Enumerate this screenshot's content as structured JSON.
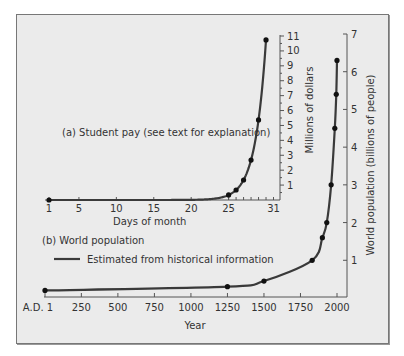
{
  "chart_data": [
    {
      "id": "a",
      "type": "line",
      "title": "(a)  Student pay (see text for explanation)",
      "xlabel": "Days of month",
      "ylabel": "Millions of dollars",
      "xticks": [
        1,
        5,
        10,
        15,
        20,
        25,
        31
      ],
      "yticks": [
        1,
        2,
        3,
        4,
        5,
        6,
        7,
        8,
        9,
        10,
        11
      ],
      "xlim": [
        1,
        31
      ],
      "ylim": [
        0,
        11
      ],
      "points": [
        {
          "x": 1,
          "y": 0.0
        },
        {
          "x": 25,
          "y": 0.34
        },
        {
          "x": 26,
          "y": 0.67
        },
        {
          "x": 27,
          "y": 1.34
        },
        {
          "x": 28,
          "y": 2.68
        },
        {
          "x": 29,
          "y": 5.37
        },
        {
          "x": 30,
          "y": 10.74
        }
      ],
      "note": "Curve doubles each day; markers on last days of month"
    },
    {
      "id": "b",
      "type": "line",
      "title": "(b)  World population",
      "legend": [
        {
          "label": "Estimated from historical information"
        }
      ],
      "xlabel": "Year",
      "ylabel": "World population (billions of people)",
      "xticks": [
        "A.D. 1",
        "250",
        "500",
        "750",
        "1000",
        "1250",
        "1500",
        "1750",
        "2000"
      ],
      "yticks": [
        1,
        2,
        3,
        4,
        5,
        6,
        7
      ],
      "xlim": [
        1,
        2000
      ],
      "ylim": [
        0,
        7
      ],
      "points": [
        {
          "x": 1,
          "y": 0.2
        },
        {
          "x": 1250,
          "y": 0.3
        },
        {
          "x": 1500,
          "y": 0.45
        },
        {
          "x": 1830,
          "y": 1.0
        },
        {
          "x": 1900,
          "y": 1.6
        },
        {
          "x": 1930,
          "y": 2.0
        },
        {
          "x": 1960,
          "y": 3.0
        },
        {
          "x": 1985,
          "y": 4.5
        },
        {
          "x": 1995,
          "y": 5.4
        },
        {
          "x": 2000,
          "y": 6.3
        }
      ]
    }
  ],
  "labels": {
    "a_title": "(a)  Student pay (see text for explanation)",
    "a_xlabel": "Days of month",
    "a_ylabel": "Millions of dollars",
    "b_title": "(b)  World population",
    "b_legend": "Estimated from historical information",
    "b_xlabel": "Year",
    "b_ylabel": "World population (billions of people)"
  },
  "colors": {
    "line": "#3a3a3a",
    "marker": "#111111",
    "axis": "#555555",
    "background": "#ebebeb"
  }
}
